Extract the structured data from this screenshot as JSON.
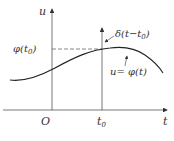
{
  "diagram": {
    "labels": {
      "u_axis": "u",
      "t_axis": "t",
      "origin": "O",
      "t0": "t",
      "t0_sub": "0",
      "phi_t0": "φ(t",
      "phi_t0_sub": "0",
      "phi_t0_close": ")",
      "delta": "δ(t−t",
      "delta_sub": "0",
      "delta_close": ")",
      "curve": "u= φ(t)"
    },
    "colors": {
      "line": "#333333",
      "background": "#ffffff"
    }
  }
}
